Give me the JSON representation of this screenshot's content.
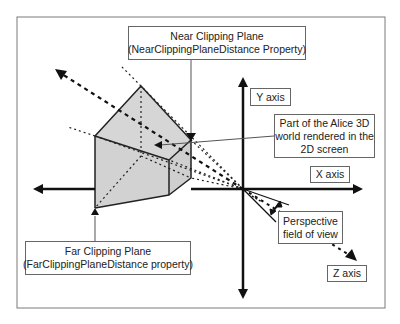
{
  "diagram": {
    "colors": {
      "frame": "#7a7a7a",
      "axis": "#111111",
      "frustum_fill": "#d6d6d6",
      "frustum_edge": "#222222",
      "leader": "#555555"
    },
    "labels": {
      "near_plane": {
        "line1": "Near Clipping Plane",
        "line2": "(NearClippingPlaneDistance Property)"
      },
      "far_plane": {
        "line1": "Far Clipping Plane",
        "line2": "(FarClippingPlaneDistance property)"
      },
      "rendered_part": {
        "line1": "Part of the Alice 3D",
        "line2": "world rendered in the",
        "line3": "2D screen"
      },
      "fov": {
        "line1": "Perspective",
        "line2": "field of view"
      },
      "y_axis": "Y axis",
      "x_axis": "X axis",
      "z_axis": "Z axis"
    },
    "nodes": [
      {
        "id": "origin",
        "label": "Camera origin"
      },
      {
        "id": "near_plane",
        "label": "Near Clipping Plane"
      },
      {
        "id": "far_plane",
        "label": "Far Clipping Plane"
      },
      {
        "id": "frustum",
        "label": "Part of the Alice 3D world rendered in the 2D screen"
      },
      {
        "id": "fov",
        "label": "Perspective field of view"
      },
      {
        "id": "x_axis",
        "label": "X axis"
      },
      {
        "id": "y_axis",
        "label": "Y axis"
      },
      {
        "id": "z_axis",
        "label": "Z axis"
      }
    ],
    "edges": [
      {
        "from": "near_plane",
        "to": "frustum",
        "type": "leader"
      },
      {
        "from": "far_plane",
        "to": "frustum",
        "type": "leader"
      },
      {
        "from": "frustum",
        "to": "rendered_part",
        "type": "leader"
      },
      {
        "from": "origin",
        "to": "frustum",
        "type": "projection"
      }
    ]
  }
}
